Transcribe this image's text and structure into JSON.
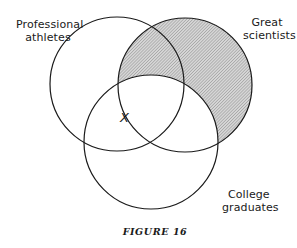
{
  "figure": {
    "caption": "FIGURE 16",
    "type": "venn-diagram",
    "sets": [
      {
        "id": "athletes",
        "label_lines": [
          "Professional",
          "athletes"
        ],
        "cx": 117,
        "cy": 84,
        "r": 67
      },
      {
        "id": "scientists",
        "label_lines": [
          "Great",
          "scientists"
        ],
        "cx": 185,
        "cy": 85,
        "r": 67
      },
      {
        "id": "college",
        "label_lines": [
          "College",
          "graduates"
        ],
        "cx": 151,
        "cy": 142,
        "r": 67
      }
    ],
    "shaded_region": "scientists minus college graduates",
    "shading_color": "#bdbdbd",
    "stroke_color": "#1a1a1a",
    "marker": {
      "symbol": "X",
      "x": 125,
      "y": 120,
      "meaning": "on boundary of great scientists, inside athletes and college graduates"
    }
  }
}
